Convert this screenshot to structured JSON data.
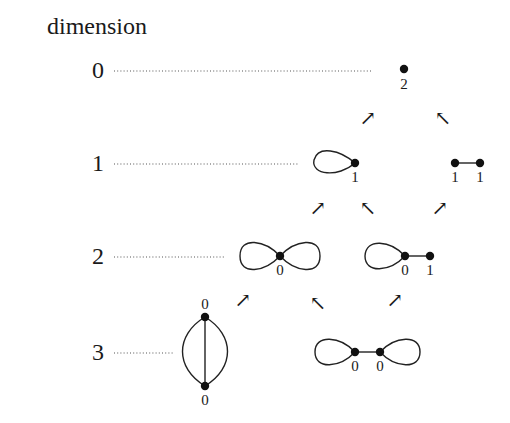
{
  "diagram": {
    "title": "dimension",
    "rows": [
      {
        "dimension": "0",
        "y": 70,
        "dots_end": 372
      },
      {
        "dimension": "1",
        "y": 163,
        "dots_end": 298
      },
      {
        "dimension": "2",
        "y": 256,
        "dots_end": 224
      },
      {
        "dimension": "3",
        "y": 352,
        "dots_end": 173
      }
    ],
    "graphs": {
      "point": {
        "vertex_label": "2"
      },
      "single_loop": {
        "vertex_label": "1"
      },
      "single_edge": {
        "labels": [
          "1",
          "1"
        ]
      },
      "figure_eight": {
        "vertex_label": "0"
      },
      "loop_with_edge": {
        "labels": [
          "0",
          "1"
        ]
      },
      "theta": {
        "labels": [
          "0",
          "0"
        ]
      },
      "dumbbell": {
        "labels": [
          "0",
          "0"
        ]
      }
    },
    "arrows": {
      "up_right_symbol": "↗",
      "up_left_symbol": "↖"
    }
  }
}
